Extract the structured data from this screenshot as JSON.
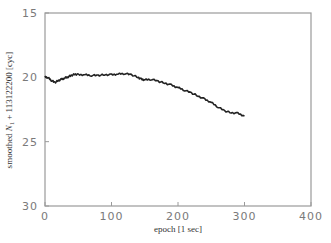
{
  "chart_data": {
    "type": "line",
    "title": "",
    "xlabel": "epoch  [1 sec]",
    "ylabel": "smoothed N_1 + 113122200  [cyc]",
    "ylabel_parts": {
      "prefix": "smoothed ",
      "var": "N",
      "sub": "1",
      "suffix": " + 113122200  [cyc]"
    },
    "xlim": [
      0,
      400
    ],
    "ylim": [
      15,
      30
    ],
    "y_inverted": true,
    "x_ticks": [
      0,
      100,
      200,
      300,
      400
    ],
    "y_ticks": [
      15,
      20,
      25,
      30
    ],
    "grid": false,
    "legend": null,
    "series": [
      {
        "name": "smoothed N1",
        "color": "#222222",
        "x": [
          0,
          5,
          10,
          15,
          20,
          25,
          30,
          35,
          40,
          45,
          50,
          60,
          70,
          80,
          90,
          100,
          110,
          120,
          130,
          140,
          145,
          150,
          160,
          170,
          180,
          190,
          200,
          210,
          220,
          230,
          240,
          250,
          260,
          270,
          280,
          290,
          300
        ],
        "y": [
          19.95,
          20.05,
          20.25,
          20.4,
          20.25,
          20.15,
          20.05,
          19.95,
          19.85,
          19.75,
          19.8,
          19.8,
          19.85,
          19.85,
          19.8,
          19.8,
          19.75,
          19.7,
          19.8,
          20.0,
          20.15,
          20.2,
          20.15,
          20.3,
          20.45,
          20.6,
          20.8,
          21.0,
          21.2,
          21.45,
          21.7,
          21.95,
          22.3,
          22.6,
          22.75,
          22.8,
          23.0
        ]
      }
    ]
  }
}
